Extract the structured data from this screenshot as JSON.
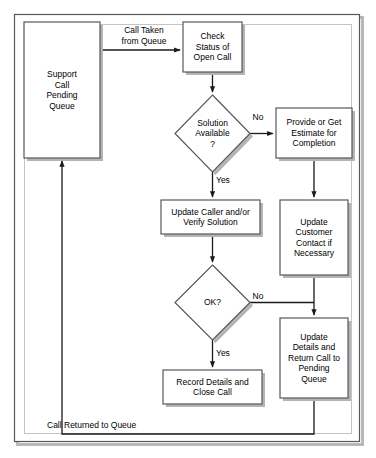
{
  "diagram": {
    "type": "flowchart",
    "border": {
      "outer_color": "#58585a",
      "inner_color": "#a8a8aa",
      "shadow_color": "#b8b8ba"
    },
    "style": {
      "node_fill": "#ffffff",
      "node_stroke": "#58585a",
      "shadow_color": "#b4b4b6",
      "line_color": "#1a1a1a",
      "text_color": "#000000"
    },
    "nodes": [
      {
        "id": "pending-queue",
        "shape": "rect",
        "label": "Support\nCall\nPending\nQueue",
        "x": 24,
        "y": 22,
        "w": 76,
        "h": 136
      },
      {
        "id": "check-status",
        "shape": "rect",
        "label": "Check\nStatus of\nOpen Call",
        "x": 183,
        "y": 22,
        "w": 59,
        "h": 50
      },
      {
        "id": "solution-available",
        "shape": "diamond",
        "label": "Solution\nAvailable\n?",
        "x": 175,
        "y": 95,
        "w": 75,
        "h": 77
      },
      {
        "id": "provide-estimate",
        "shape": "rect",
        "label": "Provide or Get\nEstimate for\nCompletion",
        "x": 276,
        "y": 108,
        "w": 76,
        "h": 50
      },
      {
        "id": "update-caller",
        "shape": "rect",
        "label": "Update Caller and/or\nVerify Solution",
        "x": 161,
        "y": 200,
        "w": 99,
        "h": 34
      },
      {
        "id": "update-customer-contact",
        "shape": "rect",
        "label": "Update\nCustomer\nContact if\nNecessary",
        "x": 280,
        "y": 200,
        "w": 68,
        "h": 75
      },
      {
        "id": "ok-decision",
        "shape": "diamond",
        "label": "OK?",
        "x": 175,
        "y": 265,
        "w": 75,
        "h": 75
      },
      {
        "id": "update-details-return",
        "shape": "rect",
        "label": "Update\nDetails and\nReturn Call to\nPending\nQueue",
        "x": 280,
        "y": 318,
        "w": 68,
        "h": 80
      },
      {
        "id": "record-details",
        "shape": "rect",
        "label": "Record Details and\nClose Call",
        "x": 163,
        "y": 370,
        "w": 99,
        "h": 34
      }
    ],
    "edge_labels": [
      {
        "id": "call-taken",
        "text": "Call Taken\nfrom Queue",
        "x": 106,
        "y": 25,
        "w": 76,
        "align": "center"
      },
      {
        "id": "solution-no",
        "text": "No",
        "x": 249,
        "y": 112,
        "w": 18,
        "align": "center"
      },
      {
        "id": "solution-yes",
        "text": "Yes",
        "x": 216,
        "y": 175,
        "w": 22,
        "align": "left"
      },
      {
        "id": "ok-no",
        "text": "No",
        "x": 249,
        "y": 295,
        "w": 18,
        "align": "center"
      },
      {
        "id": "ok-yes",
        "text": "Yes",
        "x": 216,
        "y": 348,
        "w": 22,
        "align": "left"
      },
      {
        "id": "call-returned",
        "text": "Call Returned to Queue",
        "x": 47,
        "y": 420,
        "w": 140,
        "align": "left"
      }
    ]
  }
}
